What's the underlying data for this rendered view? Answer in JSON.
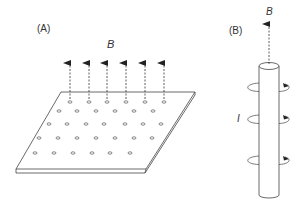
{
  "panel_a": {
    "label": "(A)",
    "field_label": "B",
    "arrow_count": 6,
    "dot_rows": 5
  },
  "panel_b": {
    "label": "(B)",
    "field_label": "B",
    "current_label": "I",
    "loop_count": 3
  },
  "colors": {
    "line": "#333333",
    "background": "#ffffff"
  }
}
